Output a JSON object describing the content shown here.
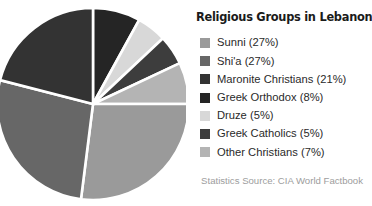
{
  "chart_data": {
    "type": "pie",
    "title": "Religious Groups in Lebanon",
    "source_note": "Statistics Source: CIA World Factbook",
    "start_angle_deg": 0,
    "direction": "clockwise",
    "total_percent": 100,
    "categories": [
      "Sunni",
      "Shi'a",
      "Maronite Christians",
      "Greek Orthodox",
      "Druze",
      "Greek Catholics",
      "Other Christians"
    ],
    "values": [
      27,
      27,
      21,
      8,
      5,
      5,
      7
    ],
    "colors": [
      "#9a9a9a",
      "#676767",
      "#333333",
      "#252525",
      "#d8d8d8",
      "#3d3d3d",
      "#b4b4b4"
    ],
    "slice_order_clockwise_from_top": [
      "Greek Orthodox",
      "Druze",
      "Greek Catholics",
      "Other Christians",
      "Sunni",
      "Shi'a",
      "Maronite Christians"
    ],
    "legend_position": "right",
    "legend_entries": [
      {
        "label": "Sunni (27%)",
        "color": "#9a9a9a",
        "value": 27
      },
      {
        "label": "Shi'a (27%)",
        "color": "#676767",
        "value": 27
      },
      {
        "label": "Maronite Christians (21%)",
        "color": "#333333",
        "value": 21
      },
      {
        "label": "Greek Orthodox (8%)",
        "color": "#252525",
        "value": 8
      },
      {
        "label": "Druze (5%)",
        "color": "#d8d8d8",
        "value": 5
      },
      {
        "label": "Greek Catholics (5%)",
        "color": "#3d3d3d",
        "value": 5
      },
      {
        "label": "Other Christians (7%)",
        "color": "#b4b4b4",
        "value": 7
      }
    ],
    "xlabel": "",
    "ylabel": "",
    "grid": false
  },
  "figure": {
    "background_color": "#ffffff",
    "slice_border_color": "#ffffff",
    "title_color": "#1b1b1b",
    "label_color": "#2a2a2a",
    "source_color": "#9d9d9d"
  }
}
